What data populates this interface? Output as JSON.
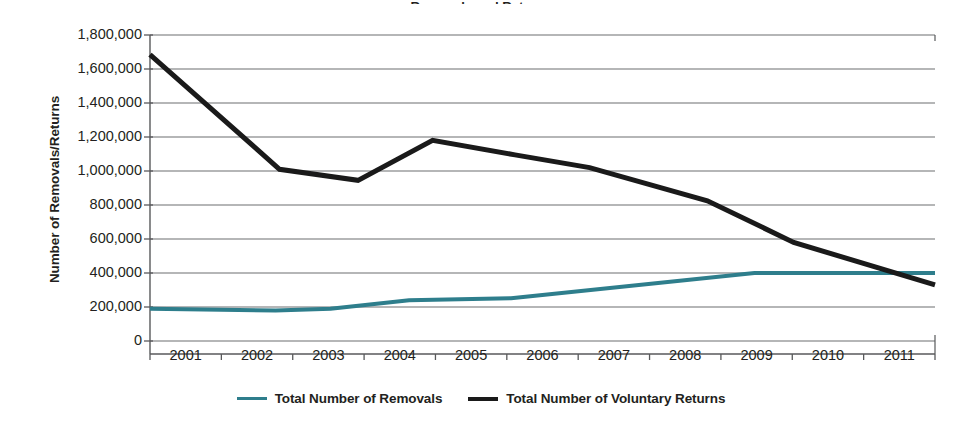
{
  "figure": {
    "width": 962,
    "height": 427,
    "background": "#ffffff",
    "title_sliver": "Removals and Returns"
  },
  "chart_data": {
    "type": "line",
    "title": "",
    "xlabel": "",
    "ylabel": "Number of Removals/Returns",
    "x": [
      2001,
      2002,
      2003,
      2004,
      2005,
      2006,
      2007,
      2008,
      2009,
      2010,
      2011
    ],
    "xtick_labels": [
      "2001",
      "2002",
      "2003",
      "2004",
      "2005",
      "2006",
      "2007",
      "2008",
      "2009",
      "2010",
      "2011"
    ],
    "ytick_labels": [
      "0",
      "200,000",
      "400,000",
      "600,000",
      "800,000",
      "1,000,000",
      "1,200,000",
      "1,400,000",
      "1,600,000",
      "1,800,000"
    ],
    "ytick_values": [
      0,
      200000,
      400000,
      600000,
      800000,
      1000000,
      1200000,
      1400000,
      1600000,
      1800000
    ],
    "ylim": [
      0,
      1800000
    ],
    "xlim": [
      2001,
      2011
    ],
    "grid": "horizontal",
    "legend_position": "bottom",
    "series": [
      {
        "name": "Total Number of Removals",
        "color": "#2e7e8c",
        "line_width": 4,
        "values": [
          189000,
          185000,
          180000,
          225000,
          245000,
          255000,
          320000,
          360000,
          400000,
          400000,
          400000
        ],
        "breakpoints": [
          {
            "x": 2001.0,
            "y": 189000
          },
          {
            "x": 2002.6,
            "y": 180000
          },
          {
            "x": 2003.3,
            "y": 190000
          },
          {
            "x": 2004.3,
            "y": 240000
          },
          {
            "x": 2005.6,
            "y": 252000
          },
          {
            "x": 2008.7,
            "y": 400000
          },
          {
            "x": 2011.0,
            "y": 400000
          }
        ]
      },
      {
        "name": "Total Number of Voluntary Returns",
        "color": "#1a1a1a",
        "line_width": 5,
        "values": [
          1685000,
          1340000,
          1010000,
          945000,
          1180000,
          1095000,
          1020000,
          890000,
          580000,
          440000,
          330000
        ],
        "breakpoints": [
          {
            "x": 2001.0,
            "y": 1685000
          },
          {
            "x": 2002.65,
            "y": 1010000
          },
          {
            "x": 2003.65,
            "y": 945000
          },
          {
            "x": 2004.6,
            "y": 1180000
          },
          {
            "x": 2005.65,
            "y": 1095000
          },
          {
            "x": 2006.6,
            "y": 1020000
          },
          {
            "x": 2008.1,
            "y": 825000
          },
          {
            "x": 2009.2,
            "y": 580000
          },
          {
            "x": 2011.0,
            "y": 330000
          }
        ]
      }
    ]
  },
  "legend": {
    "entries": [
      {
        "label": "Total Number of Removals",
        "color": "#2e7e8c"
      },
      {
        "label": "Total Number of Voluntary Returns",
        "color": "#1a1a1a"
      }
    ]
  },
  "colors": {
    "removals": "#2e7e8c",
    "returns": "#1a1a1a",
    "grid": "#6d6e71",
    "axis": "#58595b",
    "text": "#231f20"
  }
}
